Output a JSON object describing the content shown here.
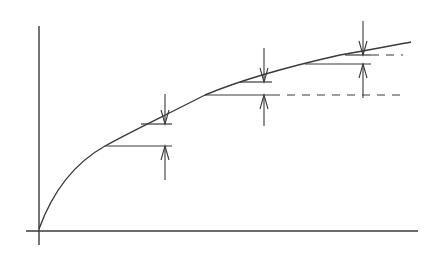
{
  "diagram": {
    "type": "concave-increasing-curve-with-step-intervals",
    "colors": {
      "line": "#3a3a3a",
      "background": "#ffffff"
    },
    "axes": {
      "y_axis": {
        "x": 39,
        "y1": 26,
        "y2": 245
      },
      "x_axis": {
        "y": 231,
        "x1": 26,
        "x2": 418
      }
    },
    "curve": {
      "path": "M39,229 C55,185 80,160 105,146 C130,132 160,118 205,95 C250,76 300,64 340,55 C370,50 395,45 411,42"
    },
    "steps": [
      {
        "label": "",
        "lower": {
          "x1": 105,
          "x2": 172,
          "y": 146
        },
        "upper": {
          "x1": 141,
          "x2": 172,
          "y": 124
        },
        "arrow_x": 165,
        "arrow_top_start": 94,
        "arrow_bottom_start": 180,
        "dashed_extension": null
      },
      {
        "label": "",
        "lower": {
          "x1": 205,
          "x2": 272,
          "y": 95
        },
        "upper": {
          "x1": 240,
          "x2": 272,
          "y": 82
        },
        "arrow_x": 264,
        "arrow_top_start": 48,
        "arrow_bottom_start": 126,
        "dashed_extension": {
          "x1": 272,
          "x2": 405,
          "y": 95
        }
      },
      {
        "label": "",
        "lower": {
          "x1": 305,
          "x2": 371,
          "y": 64
        },
        "upper": {
          "x1": 345,
          "x2": 371,
          "y": 55
        },
        "arrow_x": 363,
        "arrow_top_start": 21,
        "arrow_bottom_start": 98,
        "dashed_extension": {
          "x1": 371,
          "x2": 403,
          "y": 55
        }
      }
    ],
    "text_labels": []
  }
}
